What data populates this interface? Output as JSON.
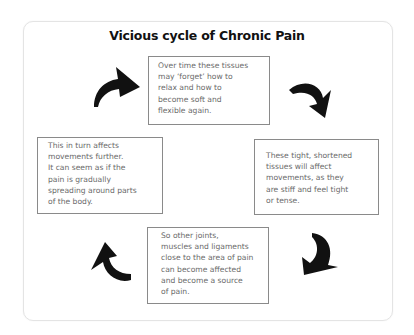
{
  "title": "Vicious cycle of Chronic Pain",
  "colors": {
    "title": "#111111",
    "box_text": "#6a6a6a",
    "box_border": "#8a8a8a",
    "frame_border": "#e4e4e4",
    "arrow": "#111111",
    "background": "#ffffff"
  },
  "boxes": {
    "top": {
      "lines": [
        "Over time these tissues",
        "may ‘forget’ how to",
        "relax and how to",
        "become soft and",
        "flexible again."
      ]
    },
    "right": {
      "lines": [
        "These tight, shortened",
        "tissues will affect",
        "movements, as they",
        "are stiff and feel tight",
        "or tense."
      ]
    },
    "bottom": {
      "lines": [
        "So other joints,",
        "muscles and ligaments",
        "close to the area of pain",
        "can become affected",
        "and become a source",
        "of pain."
      ]
    },
    "left": {
      "lines": [
        "This in turn affects",
        "movements further.",
        "It can seem as if the",
        "pain is gradually",
        "spreading around parts",
        "of the body."
      ]
    }
  },
  "arrows": [
    {
      "position": "top-left",
      "icon": "curved-arrow-up-right-icon"
    },
    {
      "position": "top-right",
      "icon": "curved-arrow-down-right-icon"
    },
    {
      "position": "bottom-right",
      "icon": "curved-arrow-down-left-icon"
    },
    {
      "position": "bottom-left",
      "icon": "curved-arrow-up-left-icon"
    }
  ]
}
